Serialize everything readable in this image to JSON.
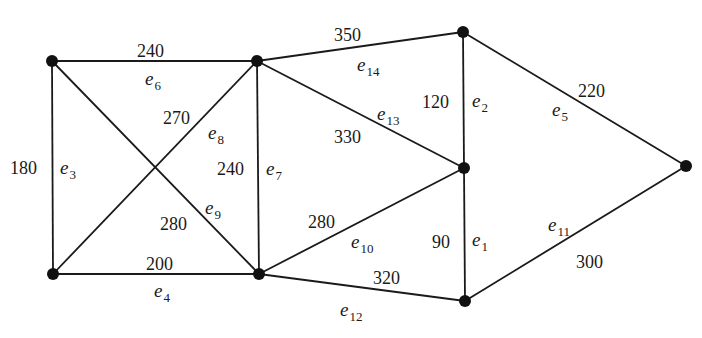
{
  "diagram": {
    "type": "weighted-undirected-graph",
    "nodes": [
      {
        "id": "A",
        "x": 52,
        "y": 61
      },
      {
        "id": "B",
        "x": 257,
        "y": 61
      },
      {
        "id": "C",
        "x": 463,
        "y": 32
      },
      {
        "id": "D",
        "x": 464,
        "y": 168
      },
      {
        "id": "E",
        "x": 686,
        "y": 166
      },
      {
        "id": "F",
        "x": 53,
        "y": 274
      },
      {
        "id": "G",
        "x": 259,
        "y": 274
      },
      {
        "id": "H",
        "x": 465,
        "y": 301
      }
    ],
    "edges": [
      {
        "name": "e",
        "sub": "1",
        "from": "D",
        "to": "H",
        "weight": "90",
        "wx": 432,
        "wy": 242,
        "ex": 472,
        "ey": 240
      },
      {
        "name": "e",
        "sub": "2",
        "from": "C",
        "to": "D",
        "weight": "120",
        "wx": 422,
        "wy": 102,
        "ex": 472,
        "ey": 101
      },
      {
        "name": "e",
        "sub": "3",
        "from": "A",
        "to": "F",
        "weight": "180",
        "wx": 10,
        "wy": 168,
        "ex": 60,
        "ey": 168
      },
      {
        "name": "e",
        "sub": "4",
        "from": "F",
        "to": "G",
        "weight": "200",
        "wx": 146,
        "wy": 264,
        "ex": 154,
        "ey": 291
      },
      {
        "name": "e",
        "sub": "5",
        "from": "C",
        "to": "E",
        "weight": "220",
        "wx": 578,
        "wy": 91,
        "ex": 552,
        "ey": 110
      },
      {
        "name": "e",
        "sub": "6",
        "from": "A",
        "to": "B",
        "weight": "240",
        "wx": 137,
        "wy": 51,
        "ex": 145,
        "ey": 79
      },
      {
        "name": "e",
        "sub": "7",
        "from": "B",
        "to": "G",
        "weight": "240",
        "wx": 217,
        "wy": 169,
        "ex": 266,
        "ey": 169
      },
      {
        "name": "e",
        "sub": "8",
        "from": "F",
        "to": "B",
        "weight": "270",
        "wx": 163,
        "wy": 118,
        "ex": 208,
        "ey": 133
      },
      {
        "name": "e",
        "sub": "9",
        "from": "A",
        "to": "G",
        "weight": "280",
        "wx": 160,
        "wy": 224,
        "ex": 205,
        "ey": 208
      },
      {
        "name": "e",
        "sub": "10",
        "from": "G",
        "to": "D",
        "weight": "280",
        "wx": 308,
        "wy": 222,
        "ex": 351,
        "ey": 242
      },
      {
        "name": "e",
        "sub": "11",
        "from": "E",
        "to": "H",
        "weight": "300",
        "wx": 576,
        "wy": 262,
        "ex": 548,
        "ey": 225
      },
      {
        "name": "e",
        "sub": "12",
        "from": "G",
        "to": "H",
        "weight": "320",
        "wx": 373,
        "wy": 278,
        "ex": 340,
        "ey": 310
      },
      {
        "name": "e",
        "sub": "13",
        "from": "B",
        "to": "D",
        "weight": "330",
        "wx": 334,
        "wy": 137,
        "ex": 377,
        "ey": 114
      },
      {
        "name": "e",
        "sub": "14",
        "from": "B",
        "to": "C",
        "weight": "350",
        "wx": 334,
        "wy": 35,
        "ex": 357,
        "ey": 65
      }
    ]
  }
}
